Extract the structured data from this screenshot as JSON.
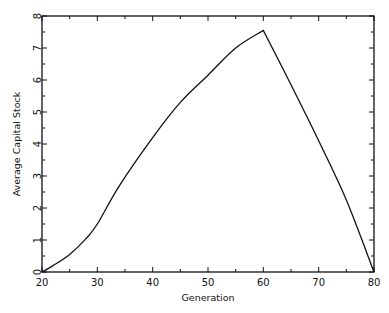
{
  "chart_data": {
    "type": "line",
    "title": "",
    "xlabel": "Generation",
    "ylabel": "Average Capital Stock",
    "xlim": [
      20,
      80
    ],
    "ylim": [
      0,
      8
    ],
    "x_ticks": [
      20,
      30,
      40,
      50,
      60,
      70,
      80
    ],
    "y_ticks": [
      0,
      1,
      2,
      3,
      4,
      5,
      6,
      7,
      8
    ],
    "grid": false,
    "legend": null,
    "series": [
      {
        "name": "Average Capital Stock",
        "color": "#111111",
        "x": [
          20,
          22,
          25,
          28,
          30,
          34,
          40,
          45,
          50,
          55,
          60,
          65,
          70,
          75,
          80
        ],
        "values": [
          0.0,
          0.2,
          0.55,
          1.05,
          1.5,
          2.7,
          4.2,
          5.3,
          6.15,
          7.0,
          7.55,
          5.85,
          4.1,
          2.25,
          0.0
        ]
      }
    ]
  }
}
